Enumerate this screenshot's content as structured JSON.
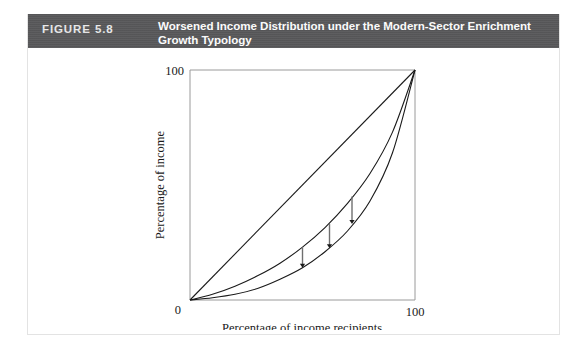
{
  "figure": {
    "number_label": "FIGURE 5.8",
    "title": "Worsened Income Distribution under the Modern-Sector Enrichment Growth Typology",
    "header_bg": "#58585a",
    "header_text_color": "#ffffff",
    "frame_border_color": "#e3e3e3",
    "page_bg": "#ffffff"
  },
  "chart_data": {
    "type": "line",
    "title": "Worsened Income Distribution under the Modern-Sector Enrichment Growth Typology",
    "xlabel": "Percentage of income recipients",
    "ylabel": "Percentage of income",
    "xlim": [
      0,
      100
    ],
    "ylim": [
      0,
      100
    ],
    "xticks": [
      0,
      100
    ],
    "yticks": [
      0,
      100
    ],
    "xtick_labels": [
      "0",
      "100"
    ],
    "ytick_labels": [
      "0",
      "100"
    ],
    "grid": false,
    "legend": null,
    "line_color": "#1a1a1a",
    "arrow_color": "#6f6f6f",
    "arrow_head_color": "#1a1a1a",
    "series": [
      {
        "name": "Line of perfect equality",
        "x": [
          0,
          100
        ],
        "values": [
          0,
          100
        ]
      },
      {
        "name": "Lorenz curve before growth",
        "x": [
          0,
          10,
          20,
          30,
          40,
          50,
          60,
          70,
          80,
          90,
          100
        ],
        "values": [
          0,
          2.5,
          6,
          10.5,
          16,
          23,
          31.5,
          42,
          55,
          73,
          100
        ]
      },
      {
        "name": "Lorenz curve after modern-sector enrichment growth",
        "x": [
          0,
          10,
          20,
          30,
          40,
          50,
          60,
          70,
          80,
          90,
          100
        ],
        "values": [
          0,
          1,
          2.5,
          5,
          9,
          14,
          21,
          30,
          43,
          64,
          100
        ]
      }
    ],
    "annotations": [
      {
        "label": "downward-shift-arrow-1",
        "x": 50,
        "y_from": 23,
        "y_to": 14
      },
      {
        "label": "downward-shift-arrow-2",
        "x": 62,
        "y_from": 33,
        "y_to": 22.5
      },
      {
        "label": "downward-shift-arrow-3",
        "x": 72,
        "y_from": 45,
        "y_to": 33
      }
    ]
  }
}
